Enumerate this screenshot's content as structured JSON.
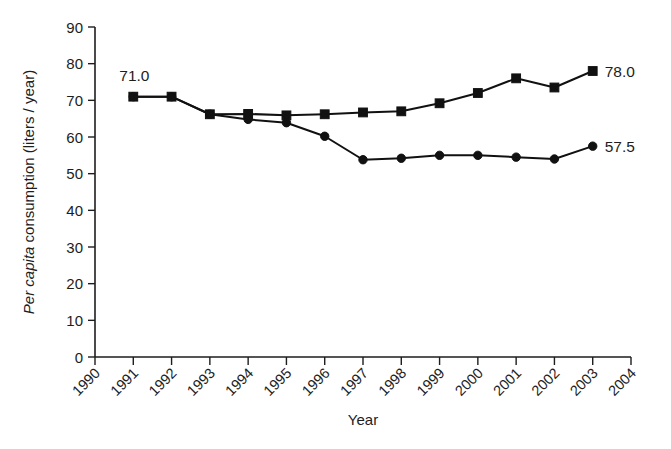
{
  "chart_data": {
    "type": "line",
    "title": "",
    "subtitle": "",
    "xlabel": "Year",
    "ylabel": "Per capita consumption (liters / year)",
    "ylabel_italic_part": "Per capita",
    "ylabel_rest": " consumption (liters / year)",
    "grid": false,
    "legend": "none",
    "xlim": [
      1990,
      2004
    ],
    "ylim": [
      0,
      90
    ],
    "xticks": [
      1990,
      1991,
      1992,
      1993,
      1994,
      1995,
      1996,
      1997,
      1998,
      1999,
      2000,
      2001,
      2002,
      2003,
      2004
    ],
    "xtick_labels": [
      "1990",
      "1991",
      "1992",
      "1993",
      "1994",
      "1995",
      "1996",
      "1997",
      "1998",
      "1999",
      "2000",
      "2001",
      "2002",
      "2003",
      "2004"
    ],
    "yticks": [
      0,
      10,
      20,
      30,
      40,
      50,
      60,
      70,
      80,
      90
    ],
    "ytick_labels": [
      "0",
      "10",
      "20",
      "30",
      "40",
      "50",
      "60",
      "70",
      "80",
      "90"
    ],
    "x": [
      1991,
      1992,
      1993,
      1994,
      1995,
      1996,
      1997,
      1998,
      1999,
      2000,
      2001,
      2002,
      2003
    ],
    "series": [
      {
        "name": "square-series",
        "marker": "square",
        "color": "#111111",
        "values": [
          71.0,
          71.0,
          66.2,
          66.3,
          65.9,
          66.2,
          66.7,
          67.0,
          69.2,
          72.0,
          76.0,
          73.5,
          78.0
        ]
      },
      {
        "name": "circle-series",
        "marker": "circle",
        "color": "#111111",
        "values": [
          71.0,
          71.0,
          66.2,
          64.8,
          63.9,
          60.2,
          53.8,
          54.2,
          55.0,
          55.0,
          54.5,
          54.0,
          57.5
        ]
      }
    ],
    "annotations": [
      {
        "name": "start-value-label",
        "text": "71.0",
        "x": 1991,
        "y": 71.0,
        "position": "above-left"
      },
      {
        "name": "square-end-value-label",
        "text": "78.0",
        "x": 2003,
        "y": 78.0,
        "position": "right"
      },
      {
        "name": "circle-end-value-label",
        "text": "57.5",
        "x": 2003,
        "y": 57.5,
        "position": "right"
      }
    ]
  }
}
